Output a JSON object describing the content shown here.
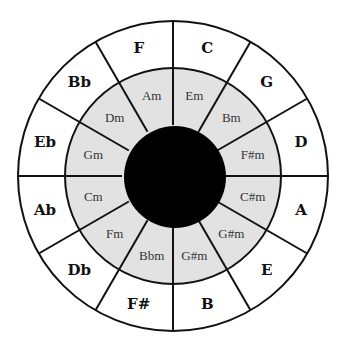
{
  "diagram": {
    "center": [
      173,
      176
    ],
    "outer_radius": 155,
    "middle_radius": 108,
    "inner_radius": 51,
    "colors": {
      "background": "#ffffff",
      "outer_ring": "#ffffff",
      "middle_ring": "#e2e2e2",
      "inner_circle": "#000000",
      "lines": "#111111"
    },
    "segments": [
      {
        "major": "C",
        "minor": "Em"
      },
      {
        "major": "G",
        "minor": "Bm"
      },
      {
        "major": "D",
        "minor": "F#m"
      },
      {
        "major": "A",
        "minor": "C#m"
      },
      {
        "major": "E",
        "minor": "G#m"
      },
      {
        "major": "B",
        "minor": "G#m"
      },
      {
        "major": "F#",
        "minor": "Bbm"
      },
      {
        "major": "Db",
        "minor": "Fm"
      },
      {
        "major": "Ab",
        "minor": "Cm"
      },
      {
        "major": "Eb",
        "minor": "Gm"
      },
      {
        "major": "Bb",
        "minor": "Dm"
      },
      {
        "major": "F",
        "minor": "Am"
      }
    ]
  }
}
